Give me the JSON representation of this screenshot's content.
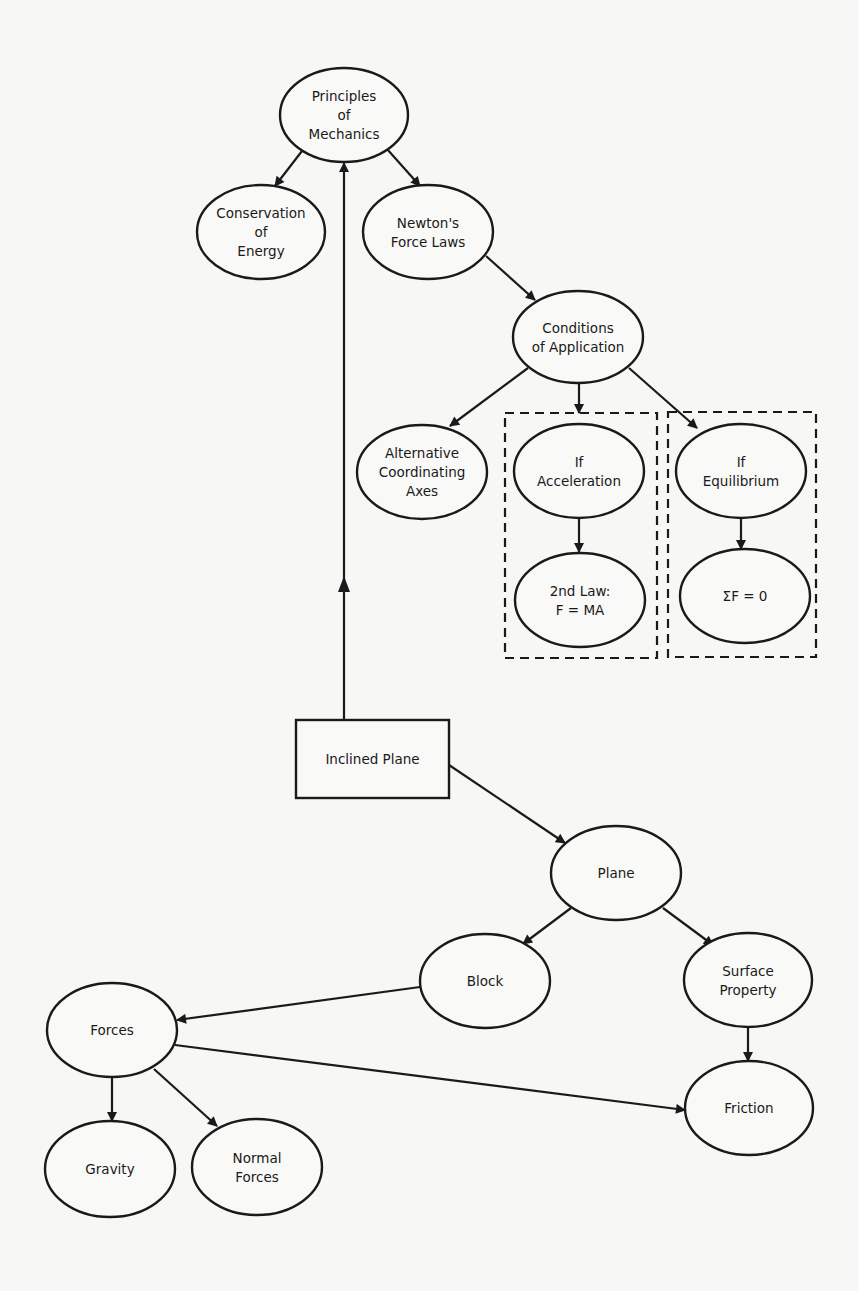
{
  "diagram": {
    "nodes": [
      {
        "id": "principles",
        "lines": [
          "Principles",
          "of",
          "Mechanics"
        ],
        "shape": "ellipse"
      },
      {
        "id": "conservation",
        "lines": [
          "Conservation",
          "of",
          "Energy"
        ],
        "shape": "ellipse"
      },
      {
        "id": "newton",
        "lines": [
          "Newton's",
          "Force Laws"
        ],
        "shape": "ellipse"
      },
      {
        "id": "conditions",
        "lines": [
          "Conditions",
          "of Application"
        ],
        "shape": "ellipse"
      },
      {
        "id": "alternative",
        "lines": [
          "Alternative",
          "Coordinating",
          "Axes"
        ],
        "shape": "ellipse"
      },
      {
        "id": "if-acceleration",
        "lines": [
          "If",
          "Acceleration"
        ],
        "shape": "ellipse"
      },
      {
        "id": "second-law",
        "lines": [
          "2nd Law:",
          "F = MA"
        ],
        "shape": "ellipse"
      },
      {
        "id": "if-equilibrium",
        "lines": [
          "If",
          "Equilibrium"
        ],
        "shape": "ellipse"
      },
      {
        "id": "sum-f-zero",
        "lines": [
          "ΣF = 0"
        ],
        "shape": "ellipse"
      },
      {
        "id": "inclined-plane",
        "lines": [
          "Inclined Plane"
        ],
        "shape": "rect"
      },
      {
        "id": "plane",
        "lines": [
          "Plane"
        ],
        "shape": "ellipse"
      },
      {
        "id": "block",
        "lines": [
          "Block"
        ],
        "shape": "ellipse"
      },
      {
        "id": "surface-property",
        "lines": [
          "Surface",
          "Property"
        ],
        "shape": "ellipse"
      },
      {
        "id": "forces",
        "lines": [
          "Forces"
        ],
        "shape": "ellipse"
      },
      {
        "id": "friction",
        "lines": [
          "Friction"
        ],
        "shape": "ellipse"
      },
      {
        "id": "gravity",
        "lines": [
          "Gravity"
        ],
        "shape": "ellipse"
      },
      {
        "id": "normal-forces",
        "lines": [
          "Normal",
          "Forces"
        ],
        "shape": "ellipse"
      }
    ],
    "edges": [
      {
        "from": "principles",
        "to": "conservation"
      },
      {
        "from": "principles",
        "to": "newton"
      },
      {
        "from": "newton",
        "to": "conditions"
      },
      {
        "from": "conditions",
        "to": "alternative"
      },
      {
        "from": "conditions",
        "to": "if-acceleration-group"
      },
      {
        "from": "conditions",
        "to": "if-equilibrium"
      },
      {
        "from": "if-acceleration",
        "to": "second-law"
      },
      {
        "from": "if-equilibrium",
        "to": "sum-f-zero"
      },
      {
        "from": "inclined-plane",
        "to": "principles"
      },
      {
        "from": "inclined-plane",
        "to": "plane"
      },
      {
        "from": "plane",
        "to": "block"
      },
      {
        "from": "plane",
        "to": "surface-property"
      },
      {
        "from": "block",
        "to": "forces"
      },
      {
        "from": "surface-property",
        "to": "friction"
      },
      {
        "from": "forces",
        "to": "friction"
      },
      {
        "from": "forces",
        "to": "gravity"
      },
      {
        "from": "forces",
        "to": "normal-forces"
      }
    ],
    "groups": [
      {
        "id": "acceleration-group",
        "members": [
          "if-acceleration",
          "second-law"
        ],
        "style": "dashed"
      },
      {
        "id": "equilibrium-group",
        "members": [
          "if-equilibrium",
          "sum-f-zero"
        ],
        "style": "dashed"
      }
    ]
  }
}
